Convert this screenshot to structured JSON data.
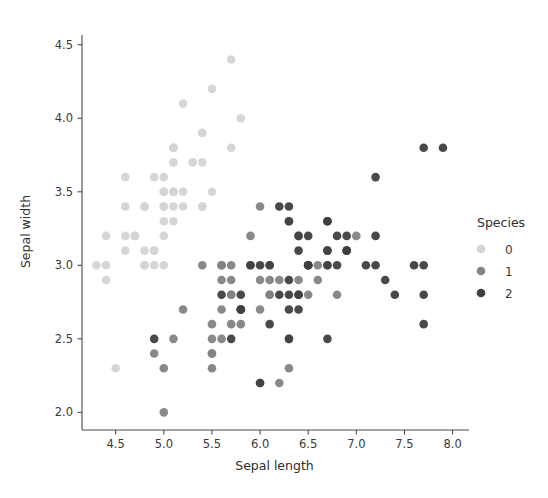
{
  "chart_data": {
    "type": "scatter",
    "title": "",
    "xlabel": "Sepal length",
    "ylabel": "Sepal width",
    "xlim": [
      4.15,
      8.15
    ],
    "ylim": [
      1.88,
      4.58
    ],
    "xticks": [
      "4.5",
      "5.0",
      "5.5",
      "6.0",
      "6.5",
      "7.0",
      "7.5",
      "8.0"
    ],
    "xtick_values": [
      4.5,
      5.0,
      5.5,
      6.0,
      6.5,
      7.0,
      7.5,
      8.0
    ],
    "yticks": [
      "2.0",
      "2.5",
      "3.0",
      "3.5",
      "4.0",
      "4.5"
    ],
    "ytick_values": [
      2.0,
      2.5,
      3.0,
      3.5,
      4.0,
      4.5
    ],
    "grid": false,
    "legend": {
      "title": "Species",
      "position": "right",
      "entries": [
        {
          "label": "0",
          "color": "#d4d4d4"
        },
        {
          "label": "1",
          "color": "#838383"
        },
        {
          "label": "2",
          "color": "#3f3f3f"
        }
      ]
    },
    "series": [
      {
        "name": "0",
        "color": "#d4d4d4",
        "points": [
          [
            5.1,
            3.5
          ],
          [
            4.9,
            3.0
          ],
          [
            4.7,
            3.2
          ],
          [
            4.6,
            3.1
          ],
          [
            5.0,
            3.6
          ],
          [
            5.4,
            3.9
          ],
          [
            4.6,
            3.4
          ],
          [
            5.0,
            3.4
          ],
          [
            4.4,
            2.9
          ],
          [
            4.9,
            3.1
          ],
          [
            5.4,
            3.7
          ],
          [
            4.8,
            3.4
          ],
          [
            4.8,
            3.0
          ],
          [
            4.3,
            3.0
          ],
          [
            5.8,
            4.0
          ],
          [
            5.7,
            4.4
          ],
          [
            5.4,
            3.9
          ],
          [
            5.1,
            3.5
          ],
          [
            5.7,
            3.8
          ],
          [
            5.1,
            3.8
          ],
          [
            5.4,
            3.4
          ],
          [
            5.1,
            3.7
          ],
          [
            4.6,
            3.6
          ],
          [
            5.1,
            3.3
          ],
          [
            4.8,
            3.4
          ],
          [
            5.0,
            3.0
          ],
          [
            5.0,
            3.4
          ],
          [
            5.2,
            3.5
          ],
          [
            5.2,
            3.4
          ],
          [
            4.7,
            3.2
          ],
          [
            4.8,
            3.1
          ],
          [
            5.4,
            3.4
          ],
          [
            5.2,
            4.1
          ],
          [
            5.5,
            4.2
          ],
          [
            4.9,
            3.1
          ],
          [
            5.0,
            3.2
          ],
          [
            5.5,
            3.5
          ],
          [
            4.9,
            3.6
          ],
          [
            4.4,
            3.0
          ],
          [
            5.1,
            3.4
          ],
          [
            5.0,
            3.5
          ],
          [
            4.5,
            2.3
          ],
          [
            4.4,
            3.2
          ],
          [
            5.0,
            3.5
          ],
          [
            5.1,
            3.8
          ],
          [
            4.8,
            3.0
          ],
          [
            5.1,
            3.8
          ],
          [
            4.6,
            3.2
          ],
          [
            5.3,
            3.7
          ],
          [
            5.0,
            3.3
          ]
        ]
      },
      {
        "name": "1",
        "color": "#838383",
        "points": [
          [
            7.0,
            3.2
          ],
          [
            6.4,
            3.2
          ],
          [
            6.9,
            3.1
          ],
          [
            5.5,
            2.3
          ],
          [
            6.5,
            2.8
          ],
          [
            5.7,
            2.8
          ],
          [
            6.3,
            3.3
          ],
          [
            4.9,
            2.4
          ],
          [
            6.6,
            2.9
          ],
          [
            5.2,
            2.7
          ],
          [
            5.0,
            2.0
          ],
          [
            5.9,
            3.0
          ],
          [
            6.0,
            2.2
          ],
          [
            6.1,
            2.9
          ],
          [
            5.6,
            2.9
          ],
          [
            6.7,
            3.1
          ],
          [
            5.6,
            3.0
          ],
          [
            5.8,
            2.7
          ],
          [
            6.2,
            2.2
          ],
          [
            5.6,
            2.5
          ],
          [
            5.9,
            3.2
          ],
          [
            6.1,
            2.8
          ],
          [
            6.3,
            2.5
          ],
          [
            6.1,
            2.8
          ],
          [
            6.4,
            2.9
          ],
          [
            6.6,
            3.0
          ],
          [
            6.8,
            2.8
          ],
          [
            6.7,
            3.0
          ],
          [
            6.0,
            2.9
          ],
          [
            5.7,
            2.6
          ],
          [
            5.5,
            2.4
          ],
          [
            5.5,
            2.4
          ],
          [
            5.8,
            2.7
          ],
          [
            6.0,
            2.7
          ],
          [
            5.4,
            3.0
          ],
          [
            6.0,
            3.4
          ],
          [
            6.7,
            3.1
          ],
          [
            6.3,
            2.3
          ],
          [
            5.6,
            3.0
          ],
          [
            5.5,
            2.5
          ],
          [
            5.5,
            2.6
          ],
          [
            6.1,
            3.0
          ],
          [
            5.8,
            2.6
          ],
          [
            5.0,
            2.3
          ],
          [
            5.6,
            2.7
          ],
          [
            5.7,
            3.0
          ],
          [
            5.7,
            2.9
          ],
          [
            6.2,
            2.9
          ],
          [
            5.1,
            2.5
          ],
          [
            5.7,
            2.8
          ]
        ]
      },
      {
        "name": "2",
        "color": "#3f3f3f",
        "points": [
          [
            6.3,
            3.3
          ],
          [
            5.8,
            2.7
          ],
          [
            7.1,
            3.0
          ],
          [
            6.3,
            2.9
          ],
          [
            6.5,
            3.0
          ],
          [
            7.6,
            3.0
          ],
          [
            4.9,
            2.5
          ],
          [
            7.3,
            2.9
          ],
          [
            6.7,
            2.5
          ],
          [
            7.2,
            3.6
          ],
          [
            6.5,
            3.2
          ],
          [
            6.4,
            2.7
          ],
          [
            6.8,
            3.0
          ],
          [
            5.7,
            2.5
          ],
          [
            5.8,
            2.8
          ],
          [
            6.4,
            3.2
          ],
          [
            6.5,
            3.0
          ],
          [
            7.7,
            3.8
          ],
          [
            7.7,
            2.6
          ],
          [
            6.0,
            2.2
          ],
          [
            6.9,
            3.2
          ],
          [
            5.6,
            2.8
          ],
          [
            7.7,
            2.8
          ],
          [
            6.3,
            2.7
          ],
          [
            6.7,
            3.3
          ],
          [
            7.2,
            3.2
          ],
          [
            6.2,
            2.8
          ],
          [
            6.1,
            3.0
          ],
          [
            6.4,
            2.8
          ],
          [
            7.2,
            3.0
          ],
          [
            7.4,
            2.8
          ],
          [
            7.9,
            3.8
          ],
          [
            6.4,
            2.8
          ],
          [
            6.3,
            2.8
          ],
          [
            6.1,
            2.6
          ],
          [
            7.7,
            3.0
          ],
          [
            6.3,
            3.4
          ],
          [
            6.4,
            3.1
          ],
          [
            6.0,
            3.0
          ],
          [
            6.9,
            3.1
          ],
          [
            6.7,
            3.1
          ],
          [
            6.9,
            3.1
          ],
          [
            5.8,
            2.7
          ],
          [
            6.8,
            3.2
          ],
          [
            6.7,
            3.3
          ],
          [
            6.7,
            3.0
          ],
          [
            6.3,
            2.5
          ],
          [
            6.5,
            3.0
          ],
          [
            6.2,
            3.4
          ],
          [
            5.9,
            3.0
          ]
        ]
      }
    ]
  },
  "axes": {
    "marker_radius": 4.3,
    "marker_opacity": 0.95
  }
}
